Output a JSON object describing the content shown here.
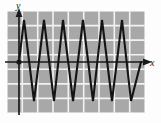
{
  "figure": {
    "kind": "coordinate-plane-graph",
    "background_color": "#fdfdfd",
    "grid_fill_color": "#a8a8a8",
    "grid_line_color": "#f2f2f2",
    "axis_color": "#1a1a1a",
    "curve_color": "#141414"
  },
  "axes": {
    "x_label": "x",
    "y_label": "y",
    "x_axis_y_px": 62,
    "y_axis_x_px": 19,
    "origin_marked": true,
    "x_arrow": "right",
    "y_arrow": "up"
  },
  "grid": {
    "left_px": 7,
    "top_px": 11,
    "width_px": 138,
    "height_px": 102,
    "columns": 9,
    "rows": 7,
    "cell_width_px": 15.33,
    "cell_height_px": 14.57,
    "visible": true
  },
  "chart_data": {
    "type": "line",
    "title": "",
    "xlabel": "x",
    "ylabel": "y",
    "grid": true,
    "legend": null,
    "waveform": "triangle",
    "amplitude_px": 42,
    "period_px": 19.6,
    "peak_y_px": 20,
    "trough_y_px": 101,
    "x": [
      19,
      24,
      34,
      44,
      54,
      63,
      73,
      83,
      93,
      102,
      112,
      122,
      131,
      141
    ],
    "y": [
      0,
      1,
      -1,
      1,
      -1,
      1,
      -1,
      1,
      -1,
      1,
      -1,
      1,
      -1,
      0.3
    ],
    "points_px": [
      {
        "x": 19,
        "y": 62
      },
      {
        "x": 24,
        "y": 20
      },
      {
        "x": 34,
        "y": 101
      },
      {
        "x": 44,
        "y": 20
      },
      {
        "x": 54,
        "y": 101
      },
      {
        "x": 63,
        "y": 20
      },
      {
        "x": 73,
        "y": 101
      },
      {
        "x": 83,
        "y": 20
      },
      {
        "x": 93,
        "y": 101
      },
      {
        "x": 102,
        "y": 20
      },
      {
        "x": 112,
        "y": 101
      },
      {
        "x": 122,
        "y": 20
      },
      {
        "x": 131,
        "y": 101
      },
      {
        "x": 141,
        "y": 62
      }
    ],
    "ylim": [
      -1.2,
      1.2
    ],
    "xlim": [
      0,
      9
    ]
  }
}
